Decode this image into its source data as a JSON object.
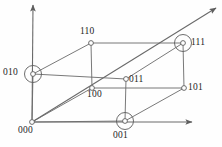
{
  "figure": {
    "name": "binary-cube-diagram",
    "width": 222,
    "height": 147,
    "background_color": "#fefefe",
    "line_color": "#6a6a6a",
    "label_color": "#1c1c1c"
  },
  "chart_data": {
    "type": "diagram",
    "title": "",
    "subtitle": "",
    "xlabel": "",
    "ylabel": "",
    "grid": false,
    "legend": "none",
    "vertices": [
      {
        "id": "v000",
        "label": "000",
        "x": 32,
        "y": 122,
        "circled": false,
        "label_x": 18,
        "label_y": 126,
        "bits": [
          0,
          0,
          0
        ]
      },
      {
        "id": "v001",
        "label": "001",
        "x": 125,
        "y": 121,
        "circled": true,
        "label_x": 113,
        "label_y": 131,
        "bits": [
          0,
          0,
          1
        ]
      },
      {
        "id": "v010",
        "label": "010",
        "x": 33,
        "y": 74,
        "circled": true,
        "label_x": 3,
        "label_y": 68,
        "bits": [
          0,
          1,
          0
        ]
      },
      {
        "id": "v011",
        "label": "011",
        "x": 126,
        "y": 79,
        "circled": false,
        "label_x": 129,
        "label_y": 75,
        "bits": [
          0,
          1,
          1
        ]
      },
      {
        "id": "v100",
        "label": "100",
        "x": 92,
        "y": 88,
        "circled": false,
        "label_x": 87,
        "label_y": 90,
        "bits": [
          1,
          0,
          0
        ]
      },
      {
        "id": "v101",
        "label": "101",
        "x": 184,
        "y": 88,
        "circled": false,
        "label_x": 188,
        "label_y": 83,
        "bits": [
          1,
          0,
          1
        ]
      },
      {
        "id": "v110",
        "label": "110",
        "x": 91,
        "y": 43,
        "circled": false,
        "label_x": 80,
        "label_y": 27,
        "bits": [
          1,
          1,
          0
        ]
      },
      {
        "id": "v111",
        "label": "111",
        "x": 183,
        "y": 43,
        "circled": true,
        "label_x": 191,
        "label_y": 38,
        "bits": [
          1,
          1,
          1
        ]
      }
    ],
    "edges": [
      {
        "from": "v000",
        "to": "v001"
      },
      {
        "from": "v000",
        "to": "v010"
      },
      {
        "from": "v000",
        "to": "v100"
      },
      {
        "from": "v010",
        "to": "v011"
      },
      {
        "from": "v010",
        "to": "v110"
      },
      {
        "from": "v001",
        "to": "v011"
      },
      {
        "from": "v001",
        "to": "v101"
      },
      {
        "from": "v100",
        "to": "v101"
      },
      {
        "from": "v100",
        "to": "v110"
      },
      {
        "from": "v011",
        "to": "v111"
      },
      {
        "from": "v101",
        "to": "v111"
      },
      {
        "from": "v110",
        "to": "v111"
      }
    ],
    "axes": [
      {
        "name": "vertical-axis",
        "x1": 32,
        "y1": 122,
        "x2": 33,
        "y2": 5,
        "arrow": true
      },
      {
        "name": "horizontal-axis",
        "x1": 32,
        "y1": 122,
        "x2": 192,
        "y2": 122,
        "arrow": true
      },
      {
        "name": "oblique-axis",
        "x1": 32,
        "y1": 122,
        "x2": 216,
        "y2": 8,
        "arrow": true
      }
    ],
    "vertex_radius": 2.4,
    "highlight_radius": 8.5
  }
}
